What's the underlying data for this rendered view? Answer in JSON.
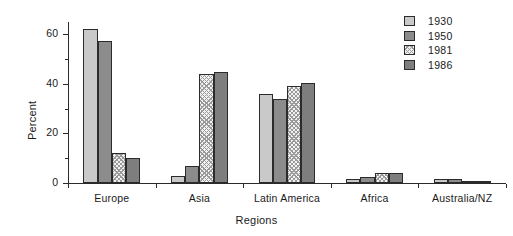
{
  "chart_data": {
    "type": "bar",
    "title": "",
    "xlabel": "Regions",
    "ylabel": "Percent",
    "ylim": [
      0,
      65
    ],
    "yticks": [
      0,
      20,
      40,
      60
    ],
    "yticks_minor": [
      10,
      30,
      50
    ],
    "grid": false,
    "legend_position": "top-right",
    "categories": [
      "Europe",
      "Asia",
      "Latin America",
      "Africa",
      "Australia/NZ"
    ],
    "series": [
      {
        "name": "1930",
        "color": "#c9c9c9",
        "values": [
          62,
          3,
          36,
          1.5,
          1.5
        ]
      },
      {
        "name": "1950",
        "color": "#8c8c8c",
        "values": [
          57.5,
          7,
          34,
          2.5,
          1.5
        ]
      },
      {
        "name": "1981",
        "color": "#f2f2f2",
        "values": [
          12,
          44,
          39,
          4,
          0.4
        ]
      },
      {
        "name": "1986",
        "color": "#7e7e7e",
        "values": [
          10,
          45,
          40.5,
          4,
          0.4
        ]
      }
    ]
  },
  "legend": {
    "items": [
      {
        "label": "1930",
        "swatch": "fill-1930"
      },
      {
        "label": "1950",
        "swatch": "fill-1950"
      },
      {
        "label": "1981",
        "swatch": "fill-1981"
      },
      {
        "label": "1986",
        "swatch": "fill-1986"
      }
    ]
  },
  "axes": {
    "y_title": "Percent",
    "x_title": "Regions",
    "y_tick_labels": [
      "0",
      "20",
      "40",
      "60"
    ]
  }
}
